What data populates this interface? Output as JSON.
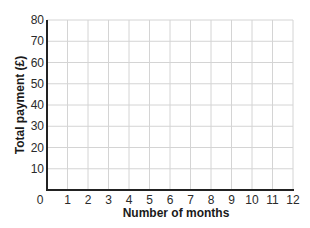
{
  "chart_data": {
    "type": "line",
    "title": "",
    "xlabel": "Number of months",
    "ylabel": "Total payment (£)",
    "x_ticks": [
      0,
      1,
      2,
      3,
      4,
      5,
      6,
      7,
      8,
      9,
      10,
      11,
      12
    ],
    "y_ticks": [
      10,
      20,
      30,
      40,
      50,
      60,
      70,
      80
    ],
    "origin_label": "0",
    "xlim": [
      0,
      12
    ],
    "ylim": [
      0,
      80
    ],
    "grid": true,
    "series": [],
    "legend": null
  },
  "colors": {
    "grid": "#d4d4d4",
    "axis": "#222222",
    "text": "#2a2a2a"
  }
}
